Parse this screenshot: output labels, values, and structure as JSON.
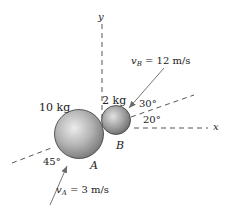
{
  "diagram": {
    "type": "collision-of-spheres",
    "axes": {
      "x_label": "x",
      "y_label": "y"
    },
    "bodies": [
      {
        "id": "A",
        "label": "A",
        "mass_label": "10 kg"
      },
      {
        "id": "B",
        "label": "B",
        "mass_label": "2 kg"
      }
    ],
    "velocities": {
      "vA": {
        "symbol": "v",
        "subscript": "A",
        "value_text": "= 3 m/s"
      },
      "vB": {
        "symbol": "v",
        "subscript": "B",
        "value_text": "= 12 m/s"
      }
    },
    "angles": {
      "a45": "45°",
      "a30": "30°",
      "a20": "20°"
    },
    "colors": {
      "sphere_light": "#e8e8e8",
      "sphere_mid": "#a8a8a8",
      "sphere_dark": "#6a6a6a",
      "line": "#333333",
      "arrow": "#777777"
    }
  }
}
